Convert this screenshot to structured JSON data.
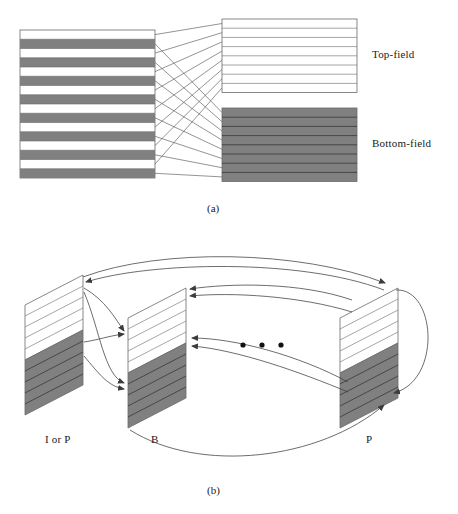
{
  "figure": {
    "caption_a": "(a)",
    "caption_b": "(b)",
    "colors": {
      "shaded_field": "#808080",
      "unshaded_field": "#ffffff",
      "stroke": "#4a4a4a",
      "background": "#ffffff"
    }
  },
  "panel_a": {
    "name": "interlaced-frame-split",
    "labels": {
      "top_field": "Top-field",
      "bottom_field": "Bottom-field"
    },
    "frame": {
      "name": "interlaced-frame",
      "line_count": 16,
      "pattern": "alternating",
      "first_line": "top-field"
    },
    "top_field_panel": {
      "lines": 8,
      "fill": "#ffffff"
    },
    "bottom_field_panel": {
      "lines": 8,
      "fill": "#808080"
    },
    "connectors": 16
  },
  "panel_b": {
    "name": "field-picture-prediction",
    "frames": [
      {
        "id": "frame-1",
        "label": "I or P",
        "top_field_fill": "#ffffff",
        "bottom_field_fill": "#808080"
      },
      {
        "id": "frame-2",
        "label": "B",
        "top_field_fill": "#ffffff",
        "bottom_field_fill": "#808080"
      },
      {
        "id": "frame-3",
        "label": "P",
        "top_field_fill": "#ffffff",
        "bottom_field_fill": "#808080"
      }
    ],
    "ellipsis": "• • •",
    "ellipsis_dots": 3,
    "prediction_arrows": 11,
    "self_loop": true
  }
}
